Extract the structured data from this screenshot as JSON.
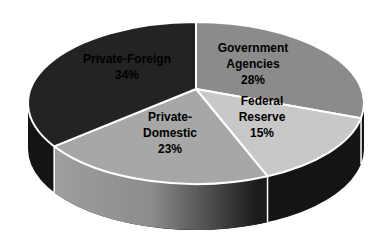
{
  "chart_data": {
    "type": "pie",
    "projection": "3d",
    "title": "",
    "legend": "none",
    "start_angle": "12-oclock",
    "direction": "clockwise",
    "unit": "%",
    "categories": [
      "Government Agencies",
      "Federal Reserve",
      "Private-Domestic",
      "Private-Foreign"
    ],
    "values": [
      28,
      15,
      23,
      34
    ],
    "slices": [
      {
        "label": "Government Agencies",
        "value": 28,
        "display": "28%",
        "color": "#8b8b8b",
        "wall": "dark"
      },
      {
        "label": "Federal Reserve",
        "value": 15,
        "display": "15%",
        "color": "#c8c8c8",
        "wall": "dark"
      },
      {
        "label": "Private-Domestic",
        "value": 23,
        "display": "23%",
        "color": "#a7a7a7",
        "wall": "gray-gradient"
      },
      {
        "label": "Private-Foreign",
        "value": 34,
        "display": "34%",
        "color": "#232323",
        "wall": "dark"
      }
    ],
    "slice_labels": [
      {
        "text": "Government\nAgencies\n28%"
      },
      {
        "text": "Federal\nReserve\n15%"
      },
      {
        "text": "Private-\nDomestic\n23%"
      },
      {
        "text": "Private-Foreign\n34%"
      }
    ],
    "wall_base_color": "#141414",
    "wall_gray_light": "#9e9e9e",
    "wall_gray_mid": "#8c8c8c",
    "wall_gray_dark": "#1c1c1c",
    "divider_color": "#ffffff",
    "slice_outline_color": "#ffffff",
    "background": "#ffffff"
  }
}
